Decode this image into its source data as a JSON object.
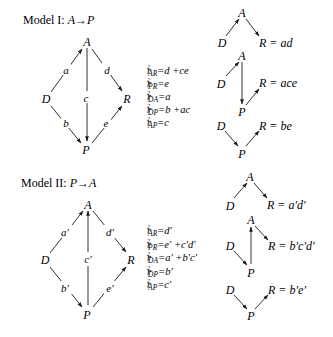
{
  "models": [
    {
      "title": "Model I: A→P",
      "title_prefix": "Model I: ",
      "title_formula": "A→P",
      "main_diagram": {
        "nodes": {
          "A": "A",
          "D": "D",
          "R": "R",
          "P": "P"
        },
        "edges": [
          {
            "from": "D",
            "to": "A",
            "label": "a"
          },
          {
            "from": "A",
            "to": "R",
            "label": "d"
          },
          {
            "from": "A",
            "to": "P",
            "label": "c"
          },
          {
            "from": "D",
            "to": "P",
            "label": "b"
          },
          {
            "from": "P",
            "to": "R",
            "label": "e"
          }
        ]
      },
      "equations": [
        {
          "sub": "AR",
          "rhs": "d +ce"
        },
        {
          "sub": "PR",
          "rhs": "e"
        },
        {
          "sub": "DA",
          "rhs": "a"
        },
        {
          "sub": "DP",
          "rhs": "b +ac"
        },
        {
          "sub": "AP",
          "rhs": "c"
        }
      ],
      "path_diagrams": [
        {
          "R_label": "R = ad"
        },
        {
          "R_label": "R = ace"
        },
        {
          "R_label": "R = be"
        }
      ]
    },
    {
      "title": "Model II: P→A",
      "title_prefix": "Model II: ",
      "title_formula": "P→A",
      "main_diagram": {
        "nodes": {
          "A": "A",
          "D": "D",
          "R": "R",
          "P": "P"
        },
        "edges": [
          {
            "from": "D",
            "to": "A",
            "label": "a′"
          },
          {
            "from": "A",
            "to": "R",
            "label": "d′"
          },
          {
            "from": "P",
            "to": "A",
            "label": "c′"
          },
          {
            "from": "D",
            "to": "P",
            "label": "b′"
          },
          {
            "from": "P",
            "to": "R",
            "label": "e′"
          }
        ]
      },
      "equations": [
        {
          "sub": "AR",
          "rhs": "d′"
        },
        {
          "sub": "PR",
          "rhs": "e′ +c′d′"
        },
        {
          "sub": "DA",
          "rhs": "a′ +b′c′"
        },
        {
          "sub": "DP",
          "rhs": "b′"
        },
        {
          "sub": "AP",
          "rhs": "c′"
        }
      ],
      "path_diagrams": [
        {
          "R_label": "R = a′d′"
        },
        {
          "R_label": "R = b′c′d′"
        },
        {
          "R_label": "R = b′e′"
        }
      ]
    }
  ],
  "equation_symbol": "r",
  "equation_power": "2",
  "equals": "="
}
